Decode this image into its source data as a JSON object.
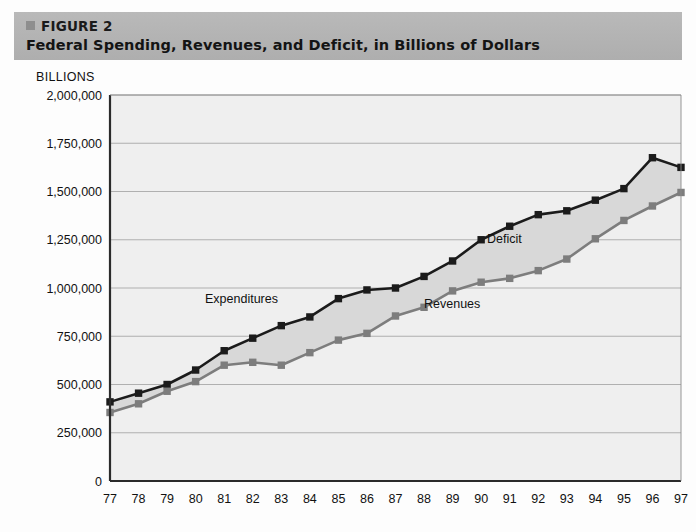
{
  "figure": {
    "bullet_icon": "square-bullet-icon",
    "label": "FIGURE 2",
    "title": "Federal Spending, Revenues, and Deficit, in Billions of Dollars"
  },
  "axis": {
    "units_caption": "BILLIONS"
  },
  "annotations": {
    "expenditures": "Expenditures",
    "revenues": "Revenues",
    "deficit": "Deficit"
  },
  "colors": {
    "header_band": "#b4b4b4",
    "expenditures_line": "#1b1b1b",
    "revenues_line": "#7d7d7d",
    "deficit_fill": "#d8d8d8",
    "plot_background": "#efefef",
    "gridline": "#a8a8a8",
    "axis": "#2b2b2b"
  },
  "chart_data": {
    "type": "line",
    "title": "Federal Spending, Revenues, and Deficit, in Billions of Dollars",
    "subtitle": "FIGURE 2",
    "xlabel": "",
    "ylabel": "BILLIONS",
    "grid": true,
    "legend": "inline-annotations",
    "xlim": [
      77,
      97
    ],
    "ylim": [
      0,
      2000000
    ],
    "ytick_labels": [
      "0",
      "250,000",
      "500,000",
      "750,000",
      "1,000,000",
      "1,250,000",
      "1,500,000",
      "1,750,000",
      "2,000,000"
    ],
    "ytick_values": [
      0,
      250000,
      500000,
      750000,
      1000000,
      1250000,
      1500000,
      1750000,
      2000000
    ],
    "categories": [
      "77",
      "78",
      "79",
      "80",
      "81",
      "82",
      "83",
      "84",
      "85",
      "86",
      "87",
      "88",
      "89",
      "90",
      "91",
      "92",
      "93",
      "94",
      "95",
      "96",
      "97"
    ],
    "series": [
      {
        "name": "Expenditures",
        "color": "#1b1b1b",
        "marker": "square",
        "values": [
          410000,
          455000,
          500000,
          575000,
          675000,
          740000,
          805000,
          850000,
          945000,
          990000,
          1000000,
          1060000,
          1140000,
          1250000,
          1320000,
          1380000,
          1400000,
          1455000,
          1515000,
          1675000,
          1625000
        ]
      },
      {
        "name": "Revenues",
        "color": "#7d7d7d",
        "marker": "square",
        "values": [
          355000,
          400000,
          465000,
          515000,
          600000,
          615000,
          600000,
          665000,
          730000,
          765000,
          855000,
          900000,
          985000,
          1030000,
          1050000,
          1090000,
          1150000,
          1255000,
          1350000,
          1425000,
          1495000
        ]
      }
    ],
    "filled_region": {
      "name": "Deficit",
      "between": [
        "Expenditures",
        "Revenues"
      ],
      "color": "#d8d8d8"
    }
  }
}
